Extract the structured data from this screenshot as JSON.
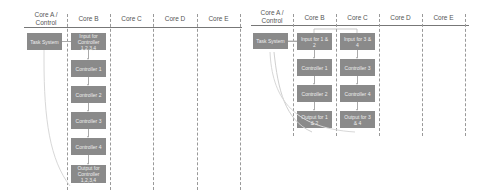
{
  "left_diagram": {
    "columns": [
      "Core A / Control",
      "Core B",
      "Core C",
      "Core D",
      "Core E"
    ],
    "core_a": [
      {
        "label": "Task System"
      }
    ],
    "core_b": [
      {
        "label": "Input for Controller 1,2,3,4"
      },
      {
        "label": "Controller 1"
      },
      {
        "label": "Controller 2"
      },
      {
        "label": "Controller 3"
      },
      {
        "label": "Controller 4"
      },
      {
        "label": "Output for Controller 1,2,3,4"
      }
    ]
  },
  "right_diagram": {
    "columns": [
      "Core A / Control",
      "Core B",
      "Core C",
      "Core D",
      "Core E"
    ],
    "core_a": [
      {
        "label": "Task System"
      }
    ],
    "core_b": [
      {
        "label": "Input for 1 & 2"
      },
      {
        "label": "Controller 1"
      },
      {
        "label": "Controller 2"
      },
      {
        "label": "Output for 1 & 2"
      }
    ],
    "core_c": [
      {
        "label": "Input for 3 & 4"
      },
      {
        "label": "Controller 3"
      },
      {
        "label": "Controller 4"
      },
      {
        "label": "Output for 3 & 4"
      }
    ]
  },
  "colors": {
    "box_fill": "#8a8a8a",
    "box_text": "#eeeeee",
    "header_text": "#555555",
    "grid_line": "#999999"
  }
}
